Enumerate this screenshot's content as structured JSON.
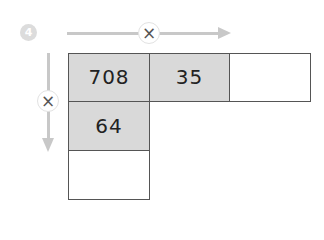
{
  "problem": {
    "number": "4",
    "operator_symbol": "×",
    "colors": {
      "filled_cell": "#d9d9d9",
      "empty_cell": "#ffffff",
      "arrow": "#c8c8c8",
      "border": "#555555",
      "badge": "#dcdcdc"
    },
    "row": [
      {
        "value": "708",
        "filled": true
      },
      {
        "value": "35",
        "filled": true
      },
      {
        "value": "",
        "filled": false
      }
    ],
    "column": [
      {
        "value": "64",
        "filled": true
      },
      {
        "value": "",
        "filled": false
      }
    ]
  }
}
